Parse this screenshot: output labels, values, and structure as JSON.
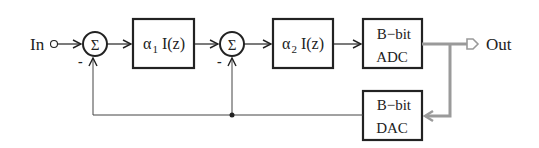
{
  "diagram": {
    "type": "block-diagram",
    "input": {
      "label": "In"
    },
    "output": {
      "label": "Out"
    },
    "summers": [
      {
        "id": "sum1",
        "symbol": "Σ",
        "minus_label": "-"
      },
      {
        "id": "sum2",
        "symbol": "Σ",
        "minus_label": "-"
      }
    ],
    "blocks": [
      {
        "id": "int1",
        "coef": "α",
        "sub": "1",
        "func": " I(z)"
      },
      {
        "id": "int2",
        "coef": "α",
        "sub": "2",
        "func": " I(z)"
      },
      {
        "id": "adc",
        "line1": "B−bit",
        "line2": "ADC"
      },
      {
        "id": "dac",
        "line1": "B−bit",
        "line2": "DAC"
      }
    ],
    "colors": {
      "line": "#222222",
      "digital_bus": "#9a9a9a",
      "background": "#ffffff"
    },
    "connections": [
      "In -> sum1 (+)",
      "sum1 -> int1",
      "int1 -> sum2 (+)",
      "sum2 -> int2",
      "int2 -> adc",
      "adc -> Out (digital bus)",
      "adc bus -> dac",
      "dac -> sum1 (-)",
      "dac -> sum2 (-)"
    ]
  }
}
